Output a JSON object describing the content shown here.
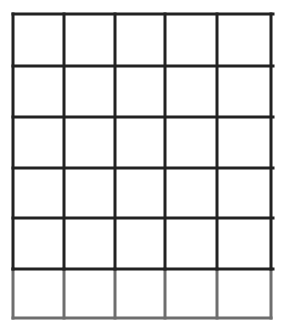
{
  "diagram": {
    "type": "grid",
    "columns": 5,
    "rows": 6,
    "x_lines": [
      13,
      64,
      115,
      165,
      217,
      271
    ],
    "y_lines": [
      14,
      66,
      117,
      168,
      218,
      269,
      318
    ],
    "line_color": "#222222",
    "last_row_line_color": "#6e6e6e",
    "line_width": 3,
    "background": "#ffffff"
  }
}
